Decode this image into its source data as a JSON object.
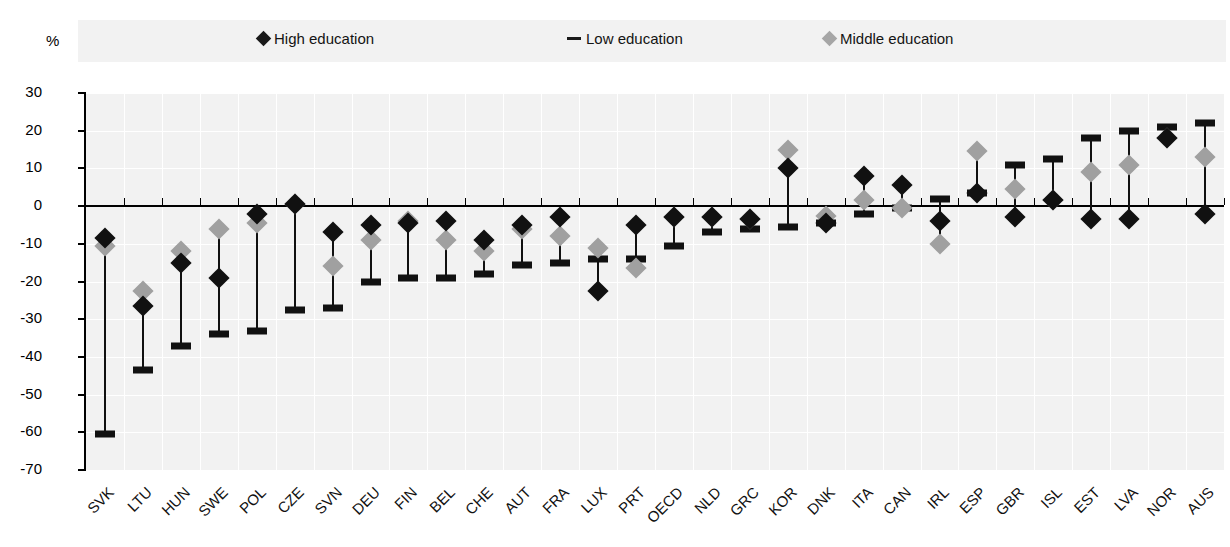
{
  "axis": {
    "unit_label": "%",
    "y_ticks": [
      30,
      20,
      10,
      0,
      -10,
      -20,
      -30,
      -40,
      -50,
      -60,
      -70
    ],
    "y_tick_labels": [
      "30",
      "20",
      "10",
      "0",
      "-10",
      "-20",
      "-30",
      "-40",
      "-50",
      "-60",
      "-70"
    ]
  },
  "legend": {
    "items": [
      {
        "label": "High education",
        "marker": "diamond-black-icon",
        "color": "#1a1a1a"
      },
      {
        "label": "Low education",
        "marker": "dash-black-icon",
        "color": "#1a1a1a"
      },
      {
        "label": "Middle education",
        "marker": "diamond-gray-icon",
        "color": "#a6a6a6"
      }
    ]
  },
  "chart_data": {
    "type": "scatter",
    "title": "",
    "subtitle": "",
    "xlabel": "",
    "ylabel": "%",
    "ylim": [
      -70,
      30
    ],
    "grid": true,
    "legend_position": "top",
    "categories": [
      "SVK",
      "LTU",
      "HUN",
      "SWE",
      "POL",
      "CZE",
      "SVN",
      "DEU",
      "FIN",
      "BEL",
      "CHE",
      "AUT",
      "FRA",
      "LUX",
      "PRT",
      "OECD",
      "NLD",
      "GRC",
      "KOR",
      "DNK",
      "ITA",
      "CAN",
      "IRL",
      "ESP",
      "GBR",
      "ISL",
      "EST",
      "LVA",
      "NOR",
      "AUS"
    ],
    "series": [
      {
        "name": "High education",
        "marker": "diamond",
        "color": "#111111",
        "values": [
          -8.5,
          -26.5,
          -15.0,
          -19.0,
          -2.0,
          0.5,
          -7.0,
          -5.0,
          -4.5,
          -4.0,
          -9.0,
          -5.0,
          -3.0,
          -22.5,
          -5.0,
          -3.0,
          -3.0,
          -3.5,
          10.0,
          -4.5,
          8.0,
          5.5,
          -4.0,
          3.5,
          -3.0,
          1.5,
          -3.5,
          -3.5,
          18.0,
          -2.0
        ]
      },
      {
        "name": "Middle education",
        "marker": "diamond",
        "color": "#a0a0a0",
        "values": [
          -10.5,
          -22.5,
          -12.0,
          -6.0,
          -4.5,
          0.5,
          -16.0,
          -9.0,
          -4.0,
          -9.0,
          -12.0,
          -6.0,
          -8.0,
          -11.0,
          -16.5,
          -3.0,
          -3.0,
          -3.5,
          15.0,
          -2.5,
          1.5,
          -0.5,
          -10.0,
          14.5,
          4.5,
          1.5,
          9.0,
          11.0,
          18.0,
          13.0
        ]
      },
      {
        "name": "Low education",
        "marker": "dash",
        "color": "#111111",
        "values": [
          -60.5,
          -43.5,
          -37.0,
          -34.0,
          -33.0,
          -27.5,
          -27.0,
          -20.0,
          -19.0,
          -19.0,
          -18.0,
          -15.5,
          -15.0,
          -14.0,
          -14.0,
          -10.5,
          -7.0,
          -6.0,
          -5.5,
          -4.5,
          -2.0,
          -0.5,
          2.0,
          3.5,
          11.0,
          12.5,
          18.0,
          20.0,
          21.0,
          22.0
        ]
      }
    ]
  }
}
